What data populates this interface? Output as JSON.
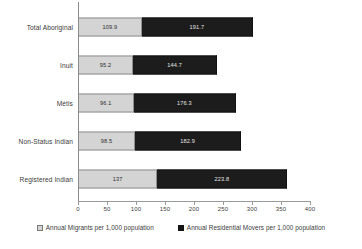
{
  "chart_data": {
    "type": "bar",
    "orientation": "horizontal",
    "stacked": true,
    "title": "",
    "subtitle": "",
    "xlabel": "",
    "ylabel": "",
    "xlim": [
      0,
      400
    ],
    "grid": false,
    "legend_position": "bottom",
    "categories": [
      "Total Aboriginal",
      "Inuit",
      "Métis",
      "Non-Status Indian",
      "Registered Indian"
    ],
    "xticks": [
      0,
      50,
      100,
      150,
      200,
      250,
      300,
      350,
      400
    ],
    "xtick_labels": [
      "0",
      "50",
      "100",
      "150",
      "200",
      "250",
      "300",
      "350",
      "400"
    ],
    "series": [
      {
        "name": "Annual Migrants per 1,000 population",
        "color": "#d4d4d4",
        "values": [
          109.9,
          95.2,
          96.1,
          98.5,
          137
        ],
        "labels": [
          "109.9",
          "95.2",
          "96.1",
          "98.5",
          "137"
        ]
      },
      {
        "name": "Annual Residential Movers per 1,000 population",
        "color": "#1c1c1c",
        "values": [
          191.7,
          144.7,
          176.3,
          182.9,
          223.8
        ],
        "labels": [
          "191.7",
          "144.7",
          "176.3",
          "182.9",
          "223.8"
        ]
      }
    ]
  },
  "legend": {
    "items": [
      {
        "label": "Annual Migrants per 1,000 population",
        "swatch": "light-square-icon"
      },
      {
        "label": "Annual Residential Movers per 1,000 population",
        "swatch": "dark-square-icon"
      }
    ]
  },
  "colors": {
    "migrants": "#d4d4d4",
    "movers": "#1c1c1c",
    "axis": "#9a9a9a",
    "text": "#3b3b3b",
    "background": "#ffffff"
  }
}
